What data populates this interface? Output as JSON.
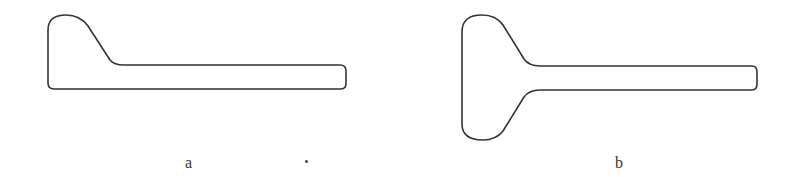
{
  "figure": {
    "panels": [
      {
        "id": "a",
        "label": "a",
        "shape": "single-sided flared bar (flare on top-left only)",
        "stroke_color": "#333333"
      },
      {
        "id": "b",
        "label": "b",
        "shape": "symmetric flared bar (T-shaped / keyhole flare on left)",
        "stroke_color": "#333333"
      }
    ],
    "background": "#ffffff"
  }
}
